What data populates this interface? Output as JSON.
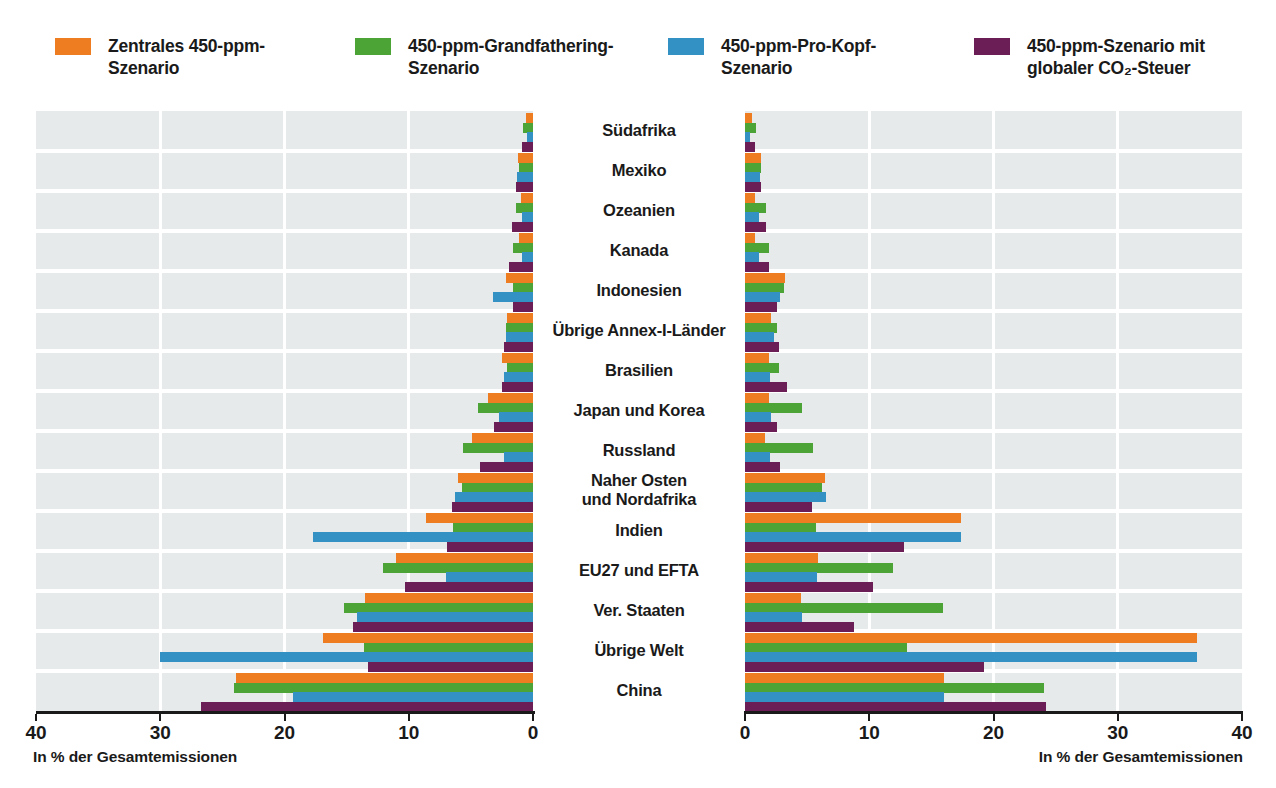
{
  "legend": {
    "items": [
      {
        "label": "Zentrales 450-ppm-\nSzenario",
        "color": "#ee7d22",
        "name": "zentrales-450-ppm-szenario"
      },
      {
        "label": "450-ppm-Grandfathering-\nSzenario",
        "color": "#4ca437",
        "name": "450-ppm-grandfathering-szenario"
      },
      {
        "label": "450-ppm-Pro-Kopf-\nSzenario",
        "color": "#3391c4",
        "name": "450-ppm-pro-kopf-szenario"
      },
      {
        "label": "450-ppm-Szenario mit\nglobaler CO₂-Steuer",
        "color": "#6b1e55",
        "name": "450-ppm-szenario-mit-globaler-co2-steuer"
      }
    ]
  },
  "axes": {
    "left": {
      "caption": "In % der Gesamtemissionen",
      "ticks": [
        "40",
        "30",
        "20",
        "10",
        "0"
      ],
      "tick_values": [
        40,
        30,
        20,
        10,
        0
      ],
      "max": 40,
      "direction": "right-to-left"
    },
    "right": {
      "caption": "In % der Gesamtemissionen",
      "ticks": [
        "0",
        "10",
        "20",
        "30",
        "40"
      ],
      "tick_values": [
        0,
        10,
        20,
        30,
        40
      ],
      "max": 40,
      "direction": "left-to-right"
    }
  },
  "chart_data": {
    "type": "bar",
    "title": "",
    "xlabel": "In % der Gesamtemissionen",
    "ylabel": "",
    "xlim": [
      0,
      40
    ],
    "grid": true,
    "legend_position": "top",
    "orientation": "horizontal-diverging",
    "panels": [
      {
        "id": "left",
        "label": "In % der Gesamtemissionen",
        "axis_reversed": true
      },
      {
        "id": "right",
        "label": "In % der Gesamtemissionen",
        "axis_reversed": false
      }
    ],
    "categories": [
      "Südafrika",
      "Mexiko",
      "Ozeanien",
      "Kanada",
      "Indonesien",
      "Übrige Annex-I-Länder",
      "Brasilien",
      "Japan und Korea",
      "Russland",
      "Naher Osten\nund Nordafrika",
      "Indien",
      "EU27 und EFTA",
      "Ver. Staaten",
      "Übrige Welt",
      "China"
    ],
    "series": [
      {
        "name": "Zentrales 450-ppm-Szenario",
        "color": "#ee7d22",
        "left_values": [
          0.6,
          1.2,
          1.0,
          1.1,
          2.2,
          2.1,
          2.5,
          3.6,
          4.9,
          6.0,
          8.6,
          11.0,
          13.5,
          16.9,
          23.9
        ],
        "right_values": [
          0.6,
          1.3,
          0.8,
          0.8,
          3.2,
          2.1,
          1.9,
          1.9,
          1.6,
          6.4,
          17.4,
          5.9,
          4.5,
          36.4,
          16.0
        ]
      },
      {
        "name": "450-ppm-Grandfathering-Szenario",
        "color": "#4ca437",
        "left_values": [
          0.8,
          1.1,
          1.4,
          1.6,
          1.6,
          2.2,
          2.1,
          4.4,
          5.6,
          5.7,
          6.4,
          12.1,
          15.2,
          13.6,
          24.1
        ],
        "right_values": [
          0.9,
          1.3,
          1.7,
          1.9,
          3.1,
          2.6,
          2.7,
          4.6,
          5.5,
          6.2,
          5.7,
          11.9,
          15.9,
          13.0,
          24.1
        ]
      },
      {
        "name": "450-ppm-Pro-Kopf-Szenario",
        "color": "#3391c4",
        "left_values": [
          0.5,
          1.3,
          0.9,
          0.9,
          3.2,
          2.2,
          2.3,
          2.7,
          2.3,
          6.3,
          17.7,
          7.0,
          14.2,
          30.0,
          19.3
        ],
        "right_values": [
          0.4,
          1.2,
          1.1,
          1.1,
          2.8,
          2.3,
          2.0,
          2.1,
          2.0,
          6.5,
          17.4,
          5.8,
          4.6,
          36.4,
          16.0
        ]
      },
      {
        "name": "450-ppm-Szenario mit globaler CO₂-Steuer",
        "color": "#6b1e55",
        "left_values": [
          0.9,
          1.4,
          1.7,
          1.9,
          1.6,
          2.3,
          2.5,
          3.1,
          4.3,
          6.5,
          6.9,
          10.3,
          14.5,
          13.3,
          26.7
        ],
        "right_values": [
          0.8,
          1.3,
          1.7,
          1.9,
          2.6,
          2.7,
          3.4,
          2.6,
          2.8,
          5.4,
          12.8,
          10.3,
          8.8,
          19.2,
          24.2
        ]
      }
    ]
  }
}
